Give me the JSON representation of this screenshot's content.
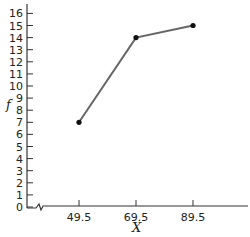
{
  "chart_data": {
    "type": "line",
    "title": "",
    "xlabel": "X",
    "ylabel": "f",
    "x": [
      49.5,
      69.5,
      89.5
    ],
    "values": [
      7,
      14,
      15
    ],
    "series": [
      {
        "name": "f",
        "x": [
          49.5,
          69.5,
          89.5
        ],
        "values": [
          7,
          14,
          15
        ]
      }
    ],
    "x_ticks": [
      "49.5",
      "69.5",
      "89.5"
    ],
    "y_ticks": [
      "0",
      "1",
      "2",
      "3",
      "4",
      "5",
      "6",
      "7",
      "8",
      "9",
      "10",
      "11",
      "12",
      "13",
      "14",
      "15",
      "16"
    ],
    "ylim": [
      0,
      16
    ],
    "grid": false,
    "axis_break_on_x": true,
    "colors": {
      "line": "#666666",
      "marker": "#111111",
      "axis": "#333333"
    }
  }
}
